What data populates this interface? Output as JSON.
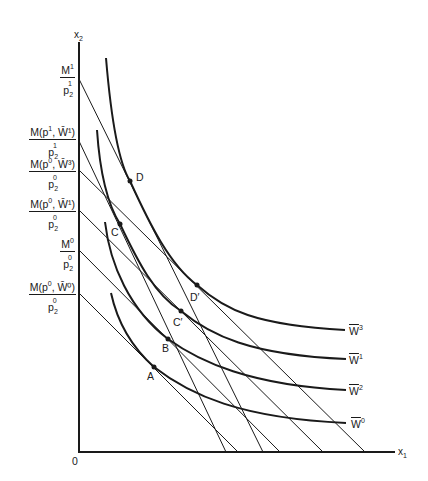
{
  "axes": {
    "x_label": "x",
    "x_label_sub": "1",
    "y_label": "x",
    "y_label_sub": "2",
    "origin_label": "0"
  },
  "y_intercept_labels": [
    {
      "num_main": "M",
      "num_sup": "1",
      "num_rest": "",
      "den_main": "p",
      "den_sub": "2",
      "den_sup": "1"
    },
    {
      "num_main": "M(p",
      "num_sup": "1",
      "num_rest": ", W̄¹)",
      "den_main": "p",
      "den_sub": "2",
      "den_sup": "1"
    },
    {
      "num_main": "M(p",
      "num_sup": "0",
      "num_rest": ", W̄³)",
      "den_main": "p",
      "den_sub": "2",
      "den_sup": "0"
    },
    {
      "num_main": "M(p",
      "num_sup": "0",
      "num_rest": ", W̄¹)",
      "den_main": "p",
      "den_sub": "2",
      "den_sup": "0"
    },
    {
      "num_main": "M",
      "num_sup": "0",
      "num_rest": "",
      "den_main": "p",
      "den_sub": "2",
      "den_sup": "0"
    },
    {
      "num_main": "M(p",
      "num_sup": "0",
      "num_rest": ", W̄⁰)",
      "den_main": "p",
      "den_sub": "2",
      "den_sup": "0"
    }
  ],
  "curves": [
    {
      "name": "W̄³",
      "label_main": "W",
      "label_sup": "3"
    },
    {
      "name": "W̄¹",
      "label_main": "W",
      "label_sup": "1"
    },
    {
      "name": "W̄²",
      "label_main": "W",
      "label_sup": "2"
    },
    {
      "name": "W̄⁰",
      "label_main": "W",
      "label_sup": "0"
    }
  ],
  "points": {
    "D": "D",
    "C": "C",
    "D_prime": "D′",
    "C_prime": "C′",
    "B": "B",
    "A": "A"
  },
  "colors": {
    "ink": "#1a1a1a",
    "background": "#ffffff"
  }
}
